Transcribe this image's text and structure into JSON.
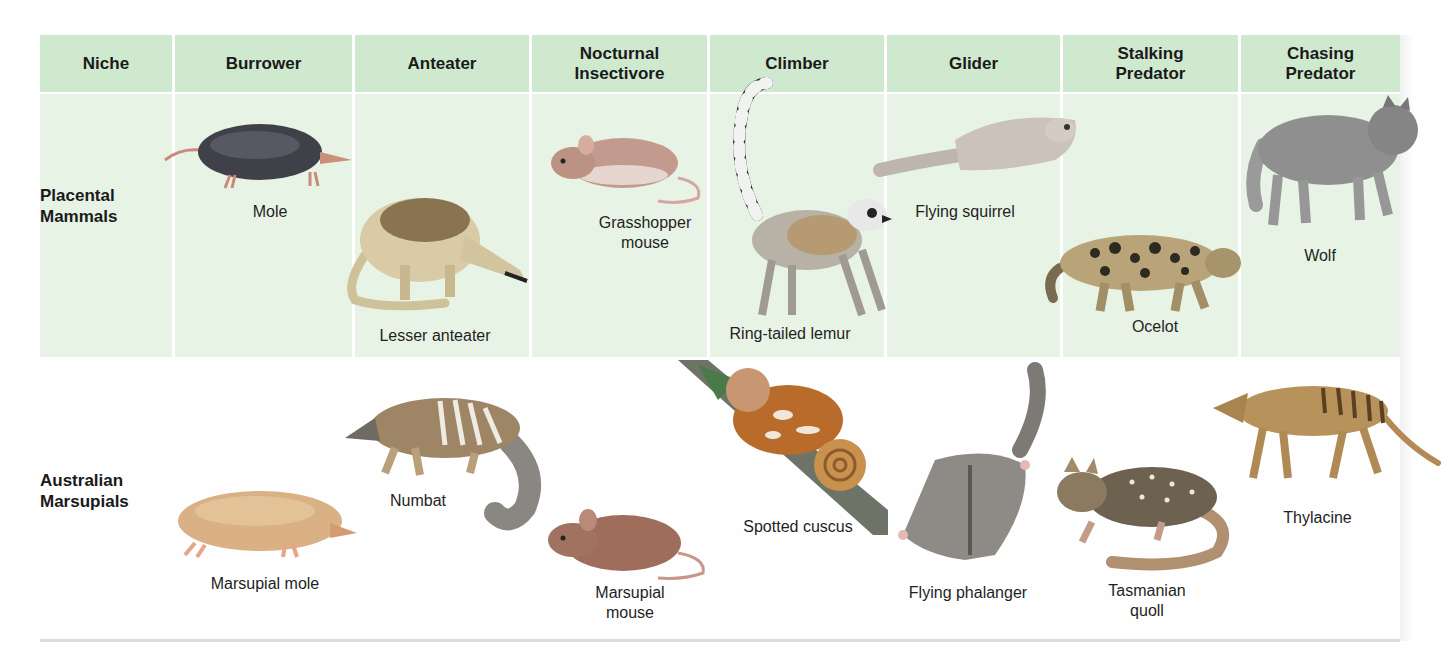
{
  "header": {
    "columns": [
      {
        "label": "Niche"
      },
      {
        "label": "Burrower"
      },
      {
        "label": "Anteater"
      },
      {
        "label": "Nocturnal Insectivore"
      },
      {
        "label": "Climber"
      },
      {
        "label": "Glider"
      },
      {
        "label": "Stalking Predator"
      },
      {
        "label": "Chasing Predator"
      }
    ]
  },
  "rows": {
    "placental": {
      "label": "Placental Mammals",
      "animals": {
        "burrower": "Mole",
        "anteater": "Lesser anteater",
        "insectivore": "Grasshopper mouse",
        "climber": "Ring-tailed lemur",
        "glider": "Flying squirrel",
        "stalking": "Ocelot",
        "chasing": "Wolf"
      }
    },
    "marsupial": {
      "label": "Australian Marsupials",
      "animals": {
        "burrower": "Marsupial mole",
        "anteater": "Numbat",
        "insectivore": "Marsupial mouse",
        "climber": "Spotted cuscus",
        "glider": "Flying phalanger",
        "stalking": "Tasmanian quoll",
        "chasing": "Thylacine"
      }
    }
  },
  "colors": {
    "header_bg": "#cfe9cf",
    "placental_row_bg": "#e7f4e5",
    "marsupial_row_bg": "#fdfefd",
    "rule": "#dcdcdc"
  }
}
